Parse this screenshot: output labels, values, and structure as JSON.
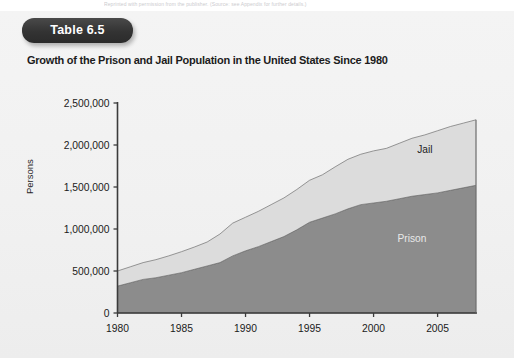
{
  "page": {
    "top_caption": "Reprinted with permission from the publisher. (Source: see Appendix for further details.)",
    "background_color": "#f1f1f1"
  },
  "badge": {
    "label": "Table 6.5",
    "background_color": "#333333",
    "text_color": "#ffffff"
  },
  "chart_data": {
    "type": "area",
    "title": "Growth of the Prison and Jail Population in the United States Since 1980",
    "xlabel": "",
    "ylabel": "Persons",
    "xlim": [
      1980,
      2008
    ],
    "ylim": [
      0,
      2500000
    ],
    "grid": false,
    "stacked": true,
    "legend_position": "inline-annotation",
    "x_ticks": [
      "1980",
      "1985",
      "1990",
      "1995",
      "2000",
      "2005"
    ],
    "x_tick_values": [
      1980,
      1985,
      1990,
      1995,
      2000,
      2005
    ],
    "y_ticks": [
      "0",
      "500,000",
      "1,000,000",
      "1,500,000",
      "2,000,000",
      "2,500,000"
    ],
    "y_tick_values": [
      0,
      500000,
      1000000,
      1500000,
      2000000,
      2500000
    ],
    "x": [
      1980,
      1981,
      1982,
      1983,
      1984,
      1985,
      1986,
      1987,
      1988,
      1989,
      1990,
      1991,
      1992,
      1993,
      1994,
      1995,
      1996,
      1997,
      1998,
      1999,
      2000,
      2001,
      2002,
      2003,
      2004,
      2005,
      2006,
      2007,
      2008
    ],
    "series": [
      {
        "name": "Prison",
        "color": "#8c8c8c",
        "label_color": "#e9e9e9",
        "values": [
          320000,
          360000,
          400000,
          420000,
          450000,
          480000,
          520000,
          560000,
          600000,
          680000,
          740000,
          790000,
          850000,
          910000,
          990000,
          1080000,
          1130000,
          1180000,
          1240000,
          1290000,
          1310000,
          1330000,
          1360000,
          1390000,
          1410000,
          1430000,
          1460000,
          1490000,
          1520000
        ]
      },
      {
        "name": "Jail",
        "color": "#dcdcdc",
        "label_color": "#1c1c1c",
        "values": [
          180000,
          190000,
          200000,
          215000,
          230000,
          250000,
          265000,
          285000,
          340000,
          390000,
          400000,
          420000,
          440000,
          460000,
          480000,
          500000,
          515000,
          560000,
          590000,
          600000,
          620000,
          630000,
          660000,
          690000,
          710000,
          740000,
          760000,
          770000,
          780000
        ]
      }
    ],
    "totals": [
      500000,
      550000,
      600000,
      635000,
      680000,
      730000,
      785000,
      845000,
      940000,
      1070000,
      1140000,
      1210000,
      1290000,
      1370000,
      1470000,
      1580000,
      1645000,
      1740000,
      1830000,
      1890000,
      1930000,
      1960000,
      2020000,
      2080000,
      2120000,
      2170000,
      2220000,
      2260000,
      2300000
    ],
    "annotations": [
      {
        "text": "Jail",
        "x": 2004,
        "y": 1900000
      },
      {
        "text": "Prison",
        "x": 2003,
        "y": 850000
      }
    ]
  }
}
